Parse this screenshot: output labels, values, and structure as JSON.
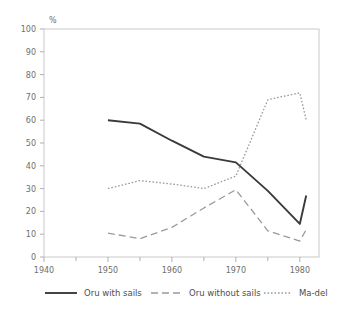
{
  "chart_data": {
    "type": "line",
    "title": "",
    "xlabel": "",
    "ylabel": "%",
    "ylim": [
      0,
      100
    ],
    "xlim": [
      1940,
      1983
    ],
    "grid": false,
    "legend_position": "bottom",
    "y_ticks": [
      0,
      10,
      20,
      30,
      40,
      50,
      60,
      70,
      80,
      90,
      100
    ],
    "y_tick_labels": [
      "0",
      "10",
      "20",
      "30",
      "40",
      "50",
      "60",
      "70",
      "80",
      "90",
      "100"
    ],
    "x_ticks": [
      1940,
      1945,
      1950,
      1955,
      1960,
      1965,
      1970,
      1975,
      1980
    ],
    "x_tick_labels": [
      "1940",
      "",
      "1950",
      "",
      "1960",
      "",
      "1970",
      "",
      "1980"
    ],
    "x_major_labels": [
      "1940",
      "1950",
      "1960",
      "1970",
      "1980"
    ],
    "series": [
      {
        "name": "Oru with sails",
        "style": "solid",
        "color": "#3a3a3a",
        "x": [
          1950,
          1955,
          1960,
          1965,
          1970,
          1975,
          1980,
          1981
        ],
        "values": [
          60,
          58.5,
          51,
          44,
          41.5,
          29,
          14.5,
          27
        ]
      },
      {
        "name": "Oru without sails",
        "style": "dashed",
        "color": "#9a9a9a",
        "x": [
          1950,
          1955,
          1960,
          1965,
          1970,
          1975,
          1980,
          1981
        ],
        "values": [
          10.5,
          8,
          13,
          21.5,
          29.5,
          11.5,
          7,
          12
        ]
      },
      {
        "name": "Ma-del",
        "style": "dotted",
        "color": "#9a9a9a",
        "x": [
          1950,
          1955,
          1960,
          1965,
          1970,
          1975,
          1980,
          1981
        ],
        "values": [
          30,
          33.5,
          32,
          30,
          35.5,
          69,
          72,
          60
        ]
      }
    ]
  },
  "legend": {
    "items": [
      {
        "label": "Oru with sails"
      },
      {
        "label": "Oru without sails"
      },
      {
        "label": "Ma-del"
      }
    ]
  },
  "axes": {
    "y_unit": "%"
  }
}
